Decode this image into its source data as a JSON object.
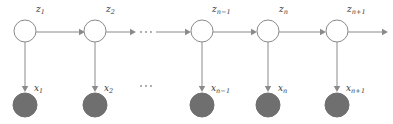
{
  "diagram": {
    "colors": {
      "background": "#ffffff",
      "latent_node_fill": "#ffffff",
      "latent_node_stroke": "#8a8a8a",
      "observed_node_fill": "#6f6f6f",
      "edge": "#8a8a8a",
      "label_text": "#3a3a3a"
    },
    "latent_nodes": [
      {
        "id": "z1",
        "label_base": "z",
        "label_sub": "1",
        "cx": 25,
        "cy": 31,
        "r": 11
      },
      {
        "id": "z2",
        "label_base": "z",
        "label_sub": "2",
        "cx": 95,
        "cy": 31,
        "r": 11
      },
      {
        "id": "zn-1",
        "label_base": "z",
        "label_sub": "n−1",
        "cx": 202,
        "cy": 31,
        "r": 11
      },
      {
        "id": "zn",
        "label_base": "z",
        "label_sub": "n",
        "cx": 268,
        "cy": 31,
        "r": 11
      },
      {
        "id": "zn+1",
        "label_base": "z",
        "label_sub": "n+1",
        "cx": 337,
        "cy": 31,
        "r": 11
      }
    ],
    "observed_nodes": [
      {
        "id": "x1",
        "label_base": "x",
        "label_sub": "1",
        "cx": 25,
        "cy": 105,
        "r": 12
      },
      {
        "id": "x2",
        "label_base": "x",
        "label_sub": "2",
        "cx": 95,
        "cy": 105,
        "r": 12
      },
      {
        "id": "xn-1",
        "label_base": "x",
        "label_sub": "n−1",
        "cx": 202,
        "cy": 105,
        "r": 12
      },
      {
        "id": "xn",
        "label_base": "x",
        "label_sub": "n",
        "cx": 268,
        "cy": 105,
        "r": 12
      },
      {
        "id": "xn+1",
        "label_base": "x",
        "label_sub": "n+1",
        "cx": 337,
        "cy": 105,
        "r": 12
      }
    ],
    "latent_labels": [
      {
        "text_base": "z",
        "text_sub": "1",
        "x": 36,
        "y": 5
      },
      {
        "text_base": "z",
        "text_sub": "2",
        "x": 106,
        "y": 5
      },
      {
        "text_base": "z",
        "text_sub": "n−1",
        "x": 212,
        "y": 5
      },
      {
        "text_base": "z",
        "text_sub": "n",
        "x": 279,
        "y": 5
      },
      {
        "text_base": "z",
        "text_sub": "n+1",
        "x": 347,
        "y": 5
      }
    ],
    "observed_labels": [
      {
        "text_base": "x",
        "text_sub": "1",
        "x": 34,
        "y": 84
      },
      {
        "text_base": "x",
        "text_sub": "2",
        "x": 104,
        "y": 84
      },
      {
        "text_base": "x",
        "text_sub": "n−1",
        "x": 211,
        "y": 84
      },
      {
        "text_base": "x",
        "text_sub": "n",
        "x": 278,
        "y": 84
      },
      {
        "text_base": "x",
        "text_sub": "n+1",
        "x": 346,
        "y": 84
      }
    ],
    "ellipses": [
      {
        "id": "top-ellipsis",
        "cx": 146,
        "cy": 32,
        "dots": 3
      },
      {
        "id": "bottom-ellipsis",
        "cx": 146,
        "cy": 86,
        "dots": 3
      }
    ],
    "horizontal_edges": [
      {
        "from": "z1",
        "to": "z2",
        "x1": 36,
        "x2": 84,
        "y": 32
      },
      {
        "from": "z2",
        "to": "ellipsis",
        "x1": 106,
        "x2": 136,
        "y": 32
      },
      {
        "from": "ellipsis",
        "to": "zn-1",
        "x1": 156,
        "x2": 191,
        "y": 32
      },
      {
        "from": "zn-1",
        "to": "zn",
        "x1": 213,
        "x2": 257,
        "y": 32
      },
      {
        "from": "zn",
        "to": "zn+1",
        "x1": 279,
        "x2": 326,
        "y": 32
      },
      {
        "from": "zn+1",
        "to": "continue",
        "x1": 348,
        "x2": 388,
        "y": 32
      }
    ],
    "vertical_edges": [
      {
        "from": "z1",
        "to": "x1",
        "x": 25,
        "y1": 42,
        "y2": 92
      },
      {
        "from": "z2",
        "to": "x2",
        "x": 95,
        "y1": 42,
        "y2": 92
      },
      {
        "from": "zn-1",
        "to": "xn-1",
        "x": 202,
        "y1": 42,
        "y2": 92
      },
      {
        "from": "zn",
        "to": "xn",
        "x": 268,
        "y1": 42,
        "y2": 92
      },
      {
        "from": "zn+1",
        "to": "xn+1",
        "x": 337,
        "y1": 42,
        "y2": 92
      }
    ]
  }
}
